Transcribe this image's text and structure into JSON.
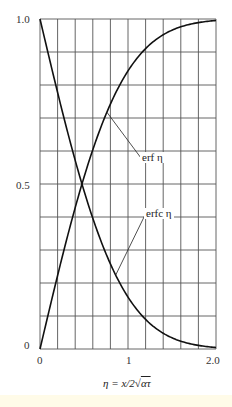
{
  "chart_data": {
    "type": "line",
    "title": "",
    "xlabel": "η = x/2√(ατ)",
    "ylabel": "",
    "xlim": [
      0,
      2.0
    ],
    "ylim": [
      0,
      1.0
    ],
    "grid": true,
    "grid_x_step": 0.2,
    "grid_y_step": 0.1,
    "x_ticks": [
      {
        "value": 0,
        "label": "0"
      },
      {
        "value": 1,
        "label": "1"
      },
      {
        "value": 2,
        "label": "2.0"
      }
    ],
    "y_ticks": [
      {
        "value": 0,
        "label": "0"
      },
      {
        "value": 0.5,
        "label": "0.5"
      },
      {
        "value": 1,
        "label": "1.0"
      }
    ],
    "x": [
      0,
      0.1,
      0.2,
      0.3,
      0.4,
      0.5,
      0.6,
      0.7,
      0.8,
      0.9,
      1.0,
      1.1,
      1.2,
      1.3,
      1.4,
      1.5,
      1.6,
      1.7,
      1.8,
      1.9,
      2.0
    ],
    "series": [
      {
        "name": "erf η",
        "values": [
          0,
          0.112,
          0.223,
          0.329,
          0.428,
          0.52,
          0.604,
          0.678,
          0.742,
          0.797,
          0.843,
          0.88,
          0.91,
          0.934,
          0.952,
          0.966,
          0.976,
          0.984,
          0.989,
          0.993,
          0.995
        ]
      },
      {
        "name": "erfc η",
        "values": [
          1,
          0.888,
          0.777,
          0.671,
          0.572,
          0.48,
          0.396,
          0.322,
          0.258,
          0.203,
          0.157,
          0.12,
          0.09,
          0.066,
          0.048,
          0.034,
          0.024,
          0.016,
          0.011,
          0.007,
          0.005
        ]
      }
    ],
    "annotations": [
      {
        "text": "erf  η",
        "target_series": "erf η"
      },
      {
        "text": "erfc   η",
        "target_series": "erfc η"
      }
    ],
    "legend_position": "none"
  },
  "labels": {
    "y_top": "1.0",
    "y_mid": "0.5",
    "y_zero": "0",
    "x_zero": "0",
    "x_one": "1",
    "x_two": "2.0",
    "x_axis_title": "η = x/2",
    "x_axis_title_root": "ατ",
    "erf_label": "erf  η",
    "erfc_label": "erfc   η"
  },
  "colors": {
    "grid": "#555555",
    "curve": "#111111",
    "text": "#222222"
  }
}
